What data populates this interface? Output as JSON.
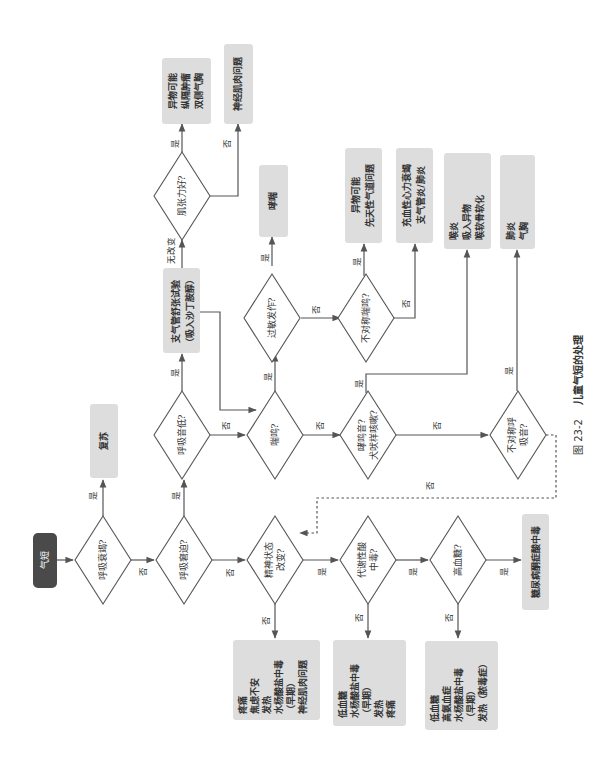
{
  "figure": {
    "caption_number": "图 23-2",
    "caption_title": "儿童气短的处理",
    "orientation": "rotated 90° counter-clockwise"
  },
  "nodes": {
    "start": "气短",
    "resp_failure": "呼吸衰竭?",
    "resuscitate": "复苏",
    "resp_distress": "呼吸窘迫?",
    "low_breath_sounds": "呼吸音低?",
    "bronchodilator_test_l1": "支气管舒张试验",
    "bronchodilator_test_l2": "（吸入沙丁胺醇）",
    "muscle_tone": "肌张力好?",
    "fb_l1": "异物可能",
    "fb_l2": "纵隔肿瘤",
    "fb_l3": "双侧气胸",
    "neuromuscular": "神经肌肉问题",
    "mental_status_l1": "精神状态",
    "mental_status_l2": "改变?",
    "wheeze": "喘鸣?",
    "allergy": "过敏发作?",
    "asthma": "哮喘",
    "asym_wheeze": "不对称喘鸣?",
    "fb2_l1": "异物可能",
    "fb2_l2": "先天性气道问题",
    "chf_l1": "充血性心力衰竭",
    "chf_l2": "支气管炎/肺炎",
    "stridor_l1": "哮鸣音?",
    "stridor_l2": "犬吠样咳嗽?",
    "croup_l1": "喉炎",
    "croup_l2": "吸入异物",
    "croup_l3": "喉软骨软化",
    "asym_breath_l1": "不对称呼",
    "asym_breath_l2": "吸音?",
    "pneumonia_l1": "肺炎",
    "pneumonia_l2": "气胸",
    "metabolic_l1": "代谢性酸",
    "metabolic_l2": "中毒?",
    "hyperglycemia": "高血糖?",
    "dka": "糖尿病酮症酸中毒",
    "pain_box": [
      "疼痛",
      "焦虑不安",
      "发热",
      "水杨酸盐中毒",
      "（早期）",
      "神经肌肉问题"
    ],
    "hypo_box1": [
      "低血糖",
      "水杨酸盐中毒",
      "（早期）",
      "发热",
      "疼痛"
    ],
    "hypo_box2": [
      "低血糖",
      "高氨血症",
      "水杨酸盐中毒",
      "（早期）",
      "发热（脓毒症）"
    ]
  },
  "edge_labels": {
    "yes": "是",
    "no": "否",
    "no_change": "无改变"
  },
  "colors": {
    "start_fill": "#4a4a4a",
    "box_fill": "#dddddd",
    "line": "#555555"
  }
}
